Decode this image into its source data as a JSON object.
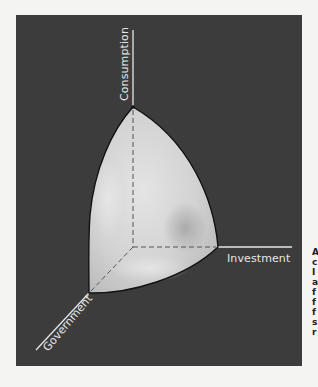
{
  "figure": {
    "axes": {
      "vertical": {
        "label": "Consumption"
      },
      "horizontal": {
        "label": "Investment"
      },
      "depth": {
        "label": "Government"
      }
    },
    "colors": {
      "panel_background": "#3c3c3c",
      "page_background": "#f4f4f2",
      "axis_line": "#e6e6e6",
      "surface_light": "#e2e2e2",
      "surface_mid": "#c9c9c9",
      "surface_shadow": "#9a9a9a",
      "outline": "#111111",
      "dashed_edge": "#555555"
    }
  },
  "caption_fragment": {
    "chars": "A\nc\nI\na\nf\nf\nf\ns\nr"
  }
}
